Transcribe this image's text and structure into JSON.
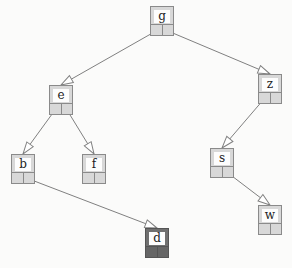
{
  "diagram": {
    "type": "binary-search-tree",
    "colors": {
      "background": "#fbfbfa",
      "node_fill": "#d8d8d8",
      "node_highlight": "#707070",
      "edge": "#808080"
    },
    "nodes": [
      {
        "id": "g",
        "label": "g",
        "x": 150,
        "y": 6,
        "highlight": false
      },
      {
        "id": "e",
        "label": "e",
        "x": 49,
        "y": 85,
        "highlight": false
      },
      {
        "id": "z",
        "label": "z",
        "x": 258,
        "y": 74,
        "highlight": false
      },
      {
        "id": "b",
        "label": "b",
        "x": 11,
        "y": 154,
        "highlight": false
      },
      {
        "id": "f",
        "label": "f",
        "x": 82,
        "y": 154,
        "highlight": false
      },
      {
        "id": "s",
        "label": "s",
        "x": 210,
        "y": 148,
        "highlight": false
      },
      {
        "id": "w",
        "label": "w",
        "x": 258,
        "y": 205,
        "highlight": false
      },
      {
        "id": "d",
        "label": "d",
        "x": 145,
        "y": 228,
        "highlight": true
      }
    ],
    "edges": [
      {
        "from": "g",
        "to": "e",
        "side": "left"
      },
      {
        "from": "g",
        "to": "z",
        "side": "right"
      },
      {
        "from": "e",
        "to": "b",
        "side": "left"
      },
      {
        "from": "e",
        "to": "f",
        "side": "right"
      },
      {
        "from": "z",
        "to": "s",
        "side": "left"
      },
      {
        "from": "b",
        "to": "d",
        "side": "right"
      },
      {
        "from": "s",
        "to": "w",
        "side": "right"
      }
    ]
  }
}
